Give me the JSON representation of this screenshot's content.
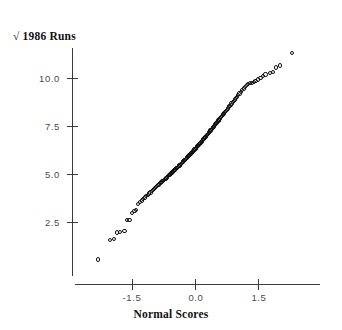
{
  "chart_data": {
    "type": "scatter",
    "title": "",
    "ylabel": "√ 1986 Runs",
    "xlabel": "Normal Scores",
    "xlim": [
      -2.35,
      2.45
    ],
    "ylim": [
      0.0,
      11.6
    ],
    "grid": false,
    "legend": null,
    "xticks": [
      -1.5,
      0.0,
      1.5
    ],
    "xticklabels": [
      "-1.5",
      "0.0",
      "1.5"
    ],
    "yticks": [
      2.5,
      5.0,
      7.5,
      10.0
    ],
    "yticklabels": [
      "2.5",
      "5.0",
      "7.5",
      "10.0"
    ],
    "marker": "open-circle",
    "marker_color": "#111111",
    "axis_color": "#3a3a3a",
    "n_points": 322,
    "x": [
      -2.3,
      -2.02,
      -1.93,
      -1.86,
      -1.79,
      -1.68,
      -1.62,
      -1.56,
      -1.5,
      -1.44,
      -1.4,
      -1.35,
      -1.31,
      -1.27,
      -1.23,
      -1.19,
      -1.16,
      -1.12,
      -1.09,
      -1.06,
      -1.03,
      -1.0,
      -0.97,
      -0.95,
      -0.92,
      -0.9,
      -0.87,
      -0.85,
      -0.82,
      -0.8,
      -0.78,
      -0.76,
      -0.74,
      -0.72,
      -0.7,
      -0.68,
      -0.66,
      -0.64,
      -0.62,
      -0.6,
      -0.58,
      -0.56,
      -0.54,
      -0.53,
      -0.51,
      -0.49,
      -0.47,
      -0.46,
      -0.44,
      -0.42,
      -0.41,
      -0.39,
      -0.37,
      -0.36,
      -0.34,
      -0.33,
      -0.31,
      -0.29,
      -0.28,
      -0.26,
      -0.25,
      -0.23,
      -0.22,
      -0.2,
      -0.19,
      -0.17,
      -0.16,
      -0.14,
      -0.13,
      -0.11,
      -0.1,
      -0.08,
      -0.07,
      -0.05,
      -0.04,
      -0.02,
      -0.01,
      0.01,
      0.02,
      0.04,
      0.05,
      0.07,
      0.08,
      0.1,
      0.11,
      0.13,
      0.14,
      0.16,
      0.17,
      0.19,
      0.2,
      0.22,
      0.23,
      0.25,
      0.26,
      0.28,
      0.29,
      0.31,
      0.33,
      0.34,
      0.36,
      0.37,
      0.39,
      0.41,
      0.42,
      0.44,
      0.46,
      0.47,
      0.49,
      0.51,
      0.53,
      0.54,
      0.56,
      0.58,
      0.6,
      0.62,
      0.64,
      0.66,
      0.68,
      0.7,
      0.72,
      0.74,
      0.76,
      0.78,
      0.8,
      0.82,
      0.85,
      0.87,
      0.9,
      0.92,
      0.95,
      0.97,
      1.0,
      1.03,
      1.06,
      1.09,
      1.12,
      1.16,
      1.19,
      1.23,
      1.27,
      1.31,
      1.35,
      1.4,
      1.44,
      1.5,
      1.56,
      1.62,
      1.68,
      1.79,
      1.86,
      1.93,
      2.02,
      2.3
    ],
    "y": [
      0.55,
      1.55,
      1.62,
      1.95,
      1.98,
      2.05,
      2.6,
      2.62,
      2.95,
      3.08,
      3.12,
      3.45,
      3.55,
      3.62,
      3.7,
      3.78,
      3.85,
      3.92,
      3.98,
      4.04,
      4.1,
      4.16,
      4.22,
      4.27,
      4.32,
      4.37,
      4.42,
      4.47,
      4.52,
      4.57,
      4.61,
      4.65,
      4.69,
      4.73,
      4.77,
      4.81,
      4.85,
      4.89,
      4.93,
      4.97,
      5.01,
      5.05,
      5.08,
      5.12,
      5.16,
      5.19,
      5.23,
      5.26,
      5.3,
      5.33,
      5.37,
      5.4,
      5.44,
      5.47,
      5.51,
      5.54,
      5.58,
      5.61,
      5.65,
      5.68,
      5.72,
      5.75,
      5.79,
      5.82,
      5.86,
      5.89,
      5.93,
      5.96,
      6.0,
      6.03,
      6.07,
      6.1,
      6.14,
      6.17,
      6.21,
      6.24,
      6.28,
      6.32,
      6.35,
      6.39,
      6.43,
      6.46,
      6.5,
      6.54,
      6.58,
      6.61,
      6.65,
      6.69,
      6.73,
      6.77,
      6.81,
      6.85,
      6.89,
      6.93,
      6.97,
      7.01,
      7.05,
      7.09,
      7.14,
      7.18,
      7.22,
      7.27,
      7.31,
      7.36,
      7.4,
      7.45,
      7.5,
      7.54,
      7.59,
      7.64,
      7.69,
      7.74,
      7.79,
      7.84,
      7.89,
      7.95,
      8.0,
      8.06,
      8.11,
      8.17,
      8.23,
      8.29,
      8.35,
      8.41,
      8.47,
      8.54,
      8.6,
      8.67,
      8.74,
      8.81,
      8.88,
      8.96,
      9.03,
      9.11,
      9.19,
      9.28,
      9.36,
      9.45,
      9.54,
      9.62,
      9.68,
      9.72,
      9.76,
      9.8,
      9.86,
      9.92,
      10.02,
      10.1,
      10.18,
      10.26,
      10.32,
      10.55,
      10.65,
      11.3
    ]
  },
  "axes": {
    "ytitle": "√ 1986 Runs",
    "xtitle": "Normal Scores",
    "yticklabels": [
      "10.0",
      "7.5",
      "5.0",
      "2.5"
    ],
    "xticklabels": [
      "-1.5",
      "0.0",
      "1.5"
    ]
  }
}
